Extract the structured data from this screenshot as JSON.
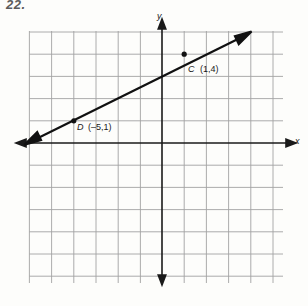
{
  "problem": {
    "number": "22."
  },
  "figure": {
    "name": "coordinate-plane-graph",
    "axis_labels": {
      "x": "x",
      "y": "y"
    },
    "grid": {
      "spacing_px": 22.2,
      "origin_px": {
        "x": 162,
        "y": 143
      },
      "x_range_cells": [
        -6,
        5
      ],
      "y_range_cells": [
        -6,
        5
      ],
      "color": "#9a9a9a",
      "axis_color": "#1a1a1a"
    },
    "line": {
      "color": "#111111",
      "double_arrow": true,
      "through_points": [
        "C",
        "D"
      ],
      "start_px": {
        "x": 27,
        "y": 143
      },
      "end_px": {
        "x": 249,
        "y": 33
      }
    },
    "points": [
      {
        "id": "C",
        "letter": "C",
        "coord_text": "(1,4)",
        "x": 1,
        "y": 4,
        "px": {
          "x": 184,
          "y": 54
        }
      },
      {
        "id": "D",
        "letter": "D",
        "coord_text": "(–5,1)",
        "x": -5,
        "y": 1,
        "px": {
          "x": 73,
          "y": 120
        }
      }
    ]
  }
}
